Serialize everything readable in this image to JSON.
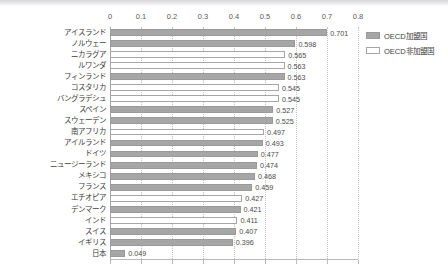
{
  "chart_data": {
    "type": "bar",
    "orientation": "horizontal",
    "title": "",
    "xlabel": "",
    "ylabel": "",
    "xlim": [
      0,
      0.8
    ],
    "xticks": [
      "0",
      "0.1",
      "0.2",
      "0.3",
      "0.4",
      "0.5",
      "0.6",
      "0.7",
      "0.8"
    ],
    "xtick_values": [
      0,
      0.1,
      0.2,
      0.3,
      0.4,
      0.5,
      0.6,
      0.7,
      0.8
    ],
    "grid": true,
    "grid_style": "dotted-vertical",
    "legend_position": "right",
    "categories": [
      "アイスランド",
      "ノルウェー",
      "ニカラグア",
      "ルワンダ",
      "フィンランド",
      "コスタリカ",
      "バングラデシュ",
      "スペイン",
      "スウェーデン",
      "南アフリカ",
      "アイルランド",
      "ドイツ",
      "ニュージーランド",
      "メキシコ",
      "フランス",
      "エチオピア",
      "デンマーク",
      "インド",
      "スイス",
      "イギリス",
      "日本"
    ],
    "values": [
      0.701,
      0.598,
      0.565,
      0.563,
      0.563,
      0.545,
      0.545,
      0.527,
      0.525,
      0.497,
      0.493,
      0.477,
      0.474,
      0.468,
      0.459,
      0.427,
      0.421,
      0.411,
      0.407,
      0.396,
      0.049
    ],
    "value_labels": [
      "0.701",
      "0.598",
      "0.565",
      "0.563",
      "0.563",
      "0.545",
      "0.545",
      "0.527",
      "0.525",
      "0.497",
      "0.493",
      "0.477",
      "0.474",
      "0.468",
      "0.459",
      "0.427",
      "0.421",
      "0.411",
      "0.407",
      "0.396",
      "0.049"
    ],
    "groups": [
      "oecd",
      "oecd",
      "nonoecd",
      "nonoecd",
      "oecd",
      "nonoecd",
      "nonoecd",
      "oecd",
      "oecd",
      "nonoecd",
      "oecd",
      "oecd",
      "oecd",
      "oecd",
      "oecd",
      "nonoecd",
      "oecd",
      "nonoecd",
      "oecd",
      "oecd",
      "oecd"
    ],
    "series": [
      {
        "name": "OECD加盟国",
        "key": "oecd",
        "color": "#a6a6a6"
      },
      {
        "name": "OECD非加盟国",
        "key": "nonoecd",
        "color": "#ffffff"
      }
    ]
  },
  "legend": {
    "items": [
      {
        "label": "OECD加盟国",
        "key": "oecd"
      },
      {
        "label": "OECD非加盟国",
        "key": "nonoecd"
      }
    ]
  },
  "colors": {
    "bar_oecd": "#a6a6a6",
    "bar_nonoecd": "#ffffff",
    "bar_border": "#a6a6a6",
    "gridline": "#c2c2c2",
    "axis": "#b9b9b9",
    "text": "#404040"
  }
}
